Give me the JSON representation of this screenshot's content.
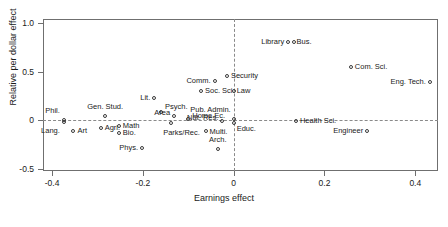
{
  "chart_data": {
    "type": "scatter",
    "title": "",
    "xlabel": "Earnings effect",
    "ylabel": "Relative per dollar effect",
    "xlim": [
      -0.42,
      0.45
    ],
    "ylim": [
      -0.52,
      1.04
    ],
    "grid": false,
    "legend": "none",
    "xticks": [
      -0.4,
      -0.2,
      0,
      0.2,
      0.4
    ],
    "xticklabels": [
      "-0.4",
      "-0.2",
      "0",
      "0.2",
      "0.4"
    ],
    "yticks": [
      -0.5,
      0,
      0.5,
      1.0
    ],
    "yticklabels": [
      "-0.5",
      "0",
      "0.5",
      "1.0"
    ],
    "reference_lines": {
      "horizontal": 0,
      "vertical": 0
    },
    "points": [
      {
        "label": "Phil.",
        "x": -0.374,
        "y": 0.0,
        "anchor": "right",
        "dx": -4,
        "dy": -9
      },
      {
        "label": "Lang.",
        "x": -0.374,
        "y": -0.012,
        "anchor": "right",
        "dx": -4,
        "dy": 9
      },
      {
        "label": "Art",
        "x": -0.353,
        "y": -0.11,
        "anchor": "left",
        "dx": 4,
        "dy": 0
      },
      {
        "label": "Agri.",
        "x": -0.293,
        "y": -0.075,
        "anchor": "left",
        "dx": 4,
        "dy": 0
      },
      {
        "label": "Gen. Stud.",
        "x": -0.283,
        "y": 0.045,
        "anchor": "mid",
        "dx": 0,
        "dy": -9
      },
      {
        "label": "Math",
        "x": -0.253,
        "y": -0.062,
        "anchor": "left",
        "dx": 4,
        "dy": 0
      },
      {
        "label": "Bio.",
        "x": -0.253,
        "y": -0.135,
        "anchor": "left",
        "dx": 4,
        "dy": 0
      },
      {
        "label": "Phys.",
        "x": -0.202,
        "y": -0.285,
        "anchor": "right",
        "dx": -4,
        "dy": 0
      },
      {
        "label": "Lit.",
        "x": -0.175,
        "y": 0.23,
        "anchor": "right",
        "dx": -4,
        "dy": 0
      },
      {
        "label": "Psych.",
        "x": -0.16,
        "y": 0.09,
        "anchor": "left",
        "dx": 4,
        "dy": -5
      },
      {
        "label": "Area",
        "x": -0.131,
        "y": 0.043,
        "anchor": "right",
        "dx": -4,
        "dy": -3
      },
      {
        "label": "Parks/Rec.",
        "x": -0.137,
        "y": -0.025,
        "anchor": "mid",
        "dx": 10,
        "dy": 10
      },
      {
        "label": "Home Ec.",
        "x": -0.1,
        "y": 0.014,
        "anchor": "left",
        "dx": 4,
        "dy": -3
      },
      {
        "label": "Comm.",
        "x": -0.042,
        "y": 0.405,
        "anchor": "right",
        "dx": -4,
        "dy": 0
      },
      {
        "label": "Soc. Sci.",
        "x": -0.072,
        "y": 0.3,
        "anchor": "left",
        "dx": 4,
        "dy": 0
      },
      {
        "label": "Nat. Res.",
        "x": -0.025,
        "y": -0.008,
        "anchor": "right",
        "dx": -4,
        "dy": -3
      },
      {
        "label": "Multi.",
        "x": -0.062,
        "y": -0.105,
        "anchor": "left",
        "dx": 4,
        "dy": 1
      },
      {
        "label": "Arch.",
        "x": -0.035,
        "y": -0.29,
        "anchor": "mid",
        "dx": 0,
        "dy": -9
      },
      {
        "label": "Security",
        "x": -0.015,
        "y": 0.45,
        "anchor": "left",
        "dx": 4,
        "dy": 0
      },
      {
        "label": "Law",
        "x": 0.0,
        "y": 0.305,
        "anchor": "left",
        "dx": 3,
        "dy": 0
      },
      {
        "label": "Pub. Admin.",
        "x": 0.0,
        "y": 0.018,
        "anchor": "right",
        "dx": -3,
        "dy": -9
      },
      {
        "label": "Educ.",
        "x": 0.0,
        "y": -0.025,
        "anchor": "left",
        "dx": 3,
        "dy": 6
      },
      {
        "label": "Library",
        "x": 0.12,
        "y": 0.8,
        "anchor": "right",
        "dx": -4,
        "dy": 0
      },
      {
        "label": "Bus.",
        "x": 0.132,
        "y": 0.8,
        "anchor": "left",
        "dx": 3,
        "dy": 0
      },
      {
        "label": "Health Sci.",
        "x": 0.137,
        "y": -0.01,
        "anchor": "left",
        "dx": 4,
        "dy": 0
      },
      {
        "label": "Com. Sci.",
        "x": 0.258,
        "y": 0.545,
        "anchor": "left",
        "dx": 4,
        "dy": 0
      },
      {
        "label": "Engineer",
        "x": 0.294,
        "y": -0.105,
        "anchor": "right",
        "dx": -4,
        "dy": 0
      },
      {
        "label": "Eng. Tech.",
        "x": 0.432,
        "y": 0.395,
        "anchor": "right",
        "dx": -4,
        "dy": 0
      }
    ]
  }
}
